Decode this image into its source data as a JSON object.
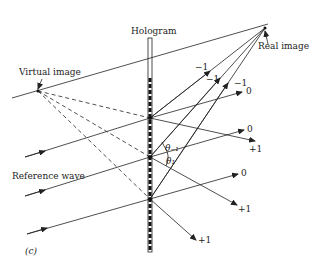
{
  "figure": {
    "panel_label": "(c)",
    "labels": {
      "hologram": "Hologram",
      "virtual_image": "Virtual image",
      "real_image": "Real image",
      "reference_wave": "Reference wave",
      "theta_minus1": "θ₋₁",
      "theta_1": "θ₁"
    },
    "orders": {
      "m1_a": "−1",
      "m1_b": "−1",
      "m1_c": "−1",
      "zero_a": "0",
      "zero_b": "0",
      "zero_c": "0",
      "p1_a": "+1",
      "p1_b": "+1",
      "p1_c": "+1"
    },
    "colors": {
      "ink": "#222222",
      "background": "#ffffff"
    }
  }
}
